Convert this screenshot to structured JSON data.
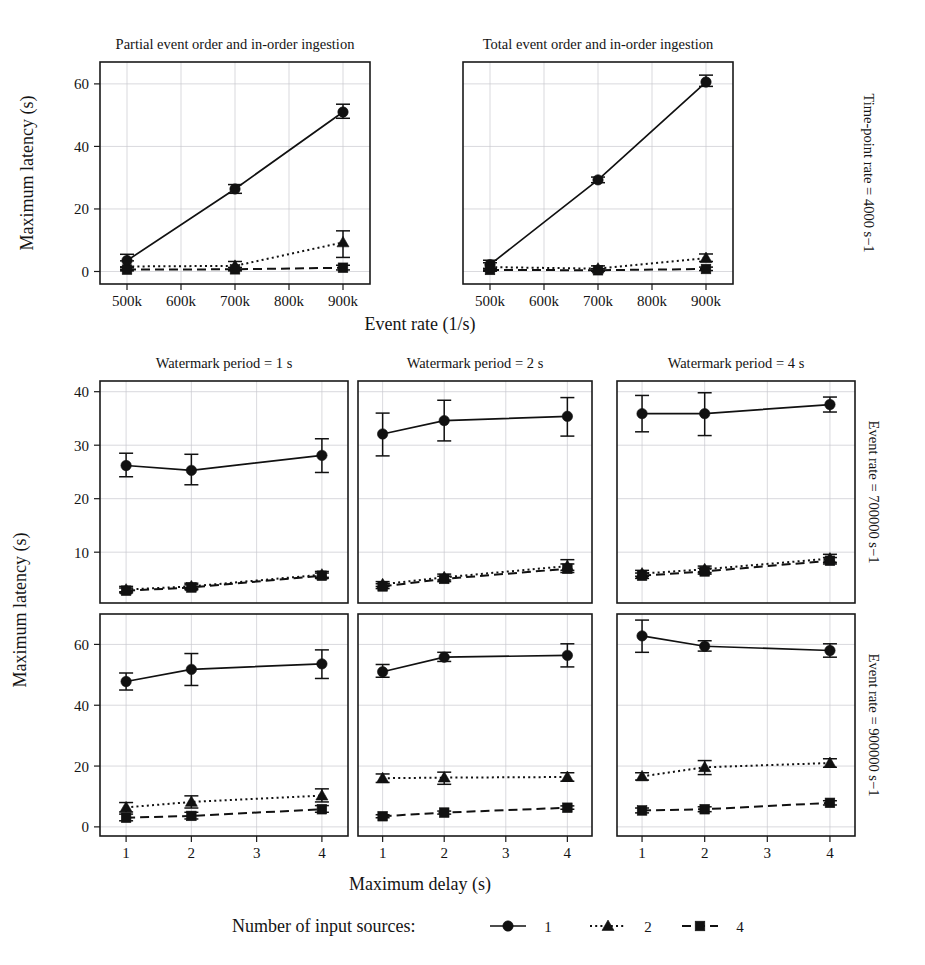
{
  "figure": {
    "axis_titles": {
      "top_x": "Event rate (1/s)",
      "bottom_x": "Maximum delay (s)",
      "y": "Maximum latency (s)"
    },
    "legend": {
      "title": "Number of input sources:",
      "entries": [
        {
          "label": "1",
          "marker": "circle",
          "dash": "solid"
        },
        {
          "label": "2",
          "marker": "triangle",
          "dash": "dotted"
        },
        {
          "label": "4",
          "marker": "square",
          "dash": "dashed"
        }
      ]
    },
    "strip_labels": {
      "top": "Time-point rate = 4000 s−1",
      "middle": "Event rate = 700000 s−1",
      "bottom": "Event rate = 900000 s−1"
    }
  },
  "chart_data": [
    {
      "type": "line",
      "panel_id": "top-left",
      "title": "Partial event order and in-order ingestion",
      "strip_right": "Time-point rate = 4000 s−1",
      "xlabel": "Event rate (1/s)",
      "ylabel": "Maximum latency (s)",
      "x": [
        500000,
        700000,
        900000
      ],
      "xtick_values": [
        500000,
        600000,
        700000,
        800000,
        900000
      ],
      "xtick_labels": [
        "500k",
        "600k",
        "700k",
        "800k",
        "900k"
      ],
      "ytick_values": [
        0,
        20,
        40,
        60
      ],
      "ytick_labels": [
        "0",
        "20",
        "40",
        "60"
      ],
      "xlim": [
        450000,
        950000
      ],
      "ylim": [
        -4,
        67
      ],
      "grid": true,
      "series": [
        {
          "name": "1",
          "marker": "circle",
          "dash": "solid",
          "values": [
            3.5,
            26.4,
            51.0
          ],
          "err_low": [
            1.5,
            25.0,
            49.0
          ],
          "err_high": [
            5.5,
            27.8,
            53.5
          ]
        },
        {
          "name": "2",
          "marker": "triangle",
          "dash": "dotted",
          "values": [
            1.6,
            1.8,
            9.3
          ],
          "err_low": [
            0.6,
            0.6,
            4.5
          ],
          "err_high": [
            3.4,
            3.2,
            13.0
          ]
        },
        {
          "name": "4",
          "marker": "square",
          "dash": "dashed",
          "values": [
            0.6,
            0.7,
            1.2
          ],
          "err_low": [
            0.2,
            0.2,
            0.5
          ],
          "err_high": [
            1.2,
            1.3,
            2.0
          ]
        }
      ]
    },
    {
      "type": "line",
      "panel_id": "top-right",
      "title": "Total event order and in-order ingestion",
      "strip_right": "Time-point rate = 4000 s−1",
      "xlabel": "Event rate (1/s)",
      "ylabel": "Maximum latency (s)",
      "x": [
        500000,
        700000,
        900000
      ],
      "xtick_values": [
        500000,
        600000,
        700000,
        800000,
        900000
      ],
      "xtick_labels": [
        "500k",
        "600k",
        "700k",
        "800k",
        "900k"
      ],
      "ytick_values": [
        0,
        20,
        40,
        60
      ],
      "ytick_labels": [
        "0",
        "20",
        "40",
        "60"
      ],
      "xlim": [
        450000,
        950000
      ],
      "ylim": [
        -4,
        67
      ],
      "grid": true,
      "series": [
        {
          "name": "1",
          "marker": "circle",
          "dash": "solid",
          "values": [
            2.2,
            29.3,
            60.6
          ],
          "err_low": [
            0.8,
            28.4,
            59.2
          ],
          "err_high": [
            3.6,
            30.2,
            62.8
          ]
        },
        {
          "name": "2",
          "marker": "triangle",
          "dash": "dotted",
          "values": [
            1.4,
            0.9,
            4.3
          ],
          "err_low": [
            0.4,
            0.3,
            3.2
          ],
          "err_high": [
            2.8,
            1.8,
            5.6
          ]
        },
        {
          "name": "4",
          "marker": "square",
          "dash": "dashed",
          "values": [
            0.5,
            0.4,
            0.8
          ],
          "err_low": [
            0.1,
            0.1,
            0.3
          ],
          "err_high": [
            1.0,
            0.9,
            1.4
          ]
        }
      ]
    },
    {
      "type": "line",
      "panel_id": "mid-wm1",
      "title": "Watermark period = 1 s",
      "strip_right": "Event rate = 700000 s−1",
      "xlabel": "Maximum delay (s)",
      "ylabel": "Maximum latency (s)",
      "x": [
        1,
        2,
        4
      ],
      "xtick_values": [
        1,
        2,
        3,
        4
      ],
      "xtick_labels": [
        "1",
        "2",
        "3",
        "4"
      ],
      "ytick_values": [
        10,
        20,
        30,
        40
      ],
      "ytick_labels": [
        "10",
        "20",
        "30",
        "40"
      ],
      "xlim": [
        0.6,
        4.4
      ],
      "ylim": [
        0.5,
        42
      ],
      "grid": true,
      "series": [
        {
          "name": "1",
          "marker": "circle",
          "dash": "solid",
          "values": [
            26.2,
            25.3,
            28.1
          ],
          "err_low": [
            24.1,
            22.6,
            24.9
          ],
          "err_high": [
            28.5,
            28.3,
            31.2
          ]
        },
        {
          "name": "2",
          "marker": "triangle",
          "dash": "dotted",
          "values": [
            3.0,
            3.6,
            5.8
          ],
          "err_low": [
            2.6,
            3.2,
            5.3
          ],
          "err_high": [
            3.6,
            4.2,
            6.4
          ]
        },
        {
          "name": "4",
          "marker": "square",
          "dash": "dashed",
          "values": [
            2.8,
            3.4,
            5.6
          ],
          "err_low": [
            2.4,
            3.0,
            5.1
          ],
          "err_high": [
            3.3,
            3.9,
            6.1
          ]
        }
      ]
    },
    {
      "type": "line",
      "panel_id": "mid-wm2",
      "title": "Watermark period = 2 s",
      "strip_right": "Event rate = 700000 s−1",
      "xlabel": "Maximum delay (s)",
      "ylabel": "Maximum latency (s)",
      "x": [
        1,
        2,
        4
      ],
      "xtick_values": [
        1,
        2,
        3,
        4
      ],
      "xtick_labels": [
        "1",
        "2",
        "3",
        "4"
      ],
      "ytick_values": [
        10,
        20,
        30,
        40
      ],
      "ytick_labels": [
        "10",
        "20",
        "30",
        "40"
      ],
      "xlim": [
        0.6,
        4.4
      ],
      "ylim": [
        0.5,
        42
      ],
      "grid": true,
      "series": [
        {
          "name": "1",
          "marker": "circle",
          "dash": "solid",
          "values": [
            32.1,
            34.6,
            35.4
          ],
          "err_low": [
            28.0,
            30.8,
            31.7
          ],
          "err_high": [
            36.0,
            38.4,
            38.9
          ]
        },
        {
          "name": "2",
          "marker": "triangle",
          "dash": "dotted",
          "values": [
            4.0,
            5.3,
            7.4
          ],
          "err_low": [
            3.6,
            4.8,
            6.6
          ],
          "err_high": [
            4.5,
            5.9,
            8.6
          ]
        },
        {
          "name": "4",
          "marker": "square",
          "dash": "dashed",
          "values": [
            3.6,
            5.0,
            6.9
          ],
          "err_low": [
            3.2,
            4.5,
            6.2
          ],
          "err_high": [
            4.1,
            5.5,
            7.8
          ]
        }
      ]
    },
    {
      "type": "line",
      "panel_id": "mid-wm4",
      "title": "Watermark period = 4 s",
      "strip_right": "Event rate = 700000 s−1",
      "xlabel": "Maximum delay (s)",
      "ylabel": "Maximum latency (s)",
      "x": [
        1,
        2,
        4
      ],
      "xtick_values": [
        1,
        2,
        3,
        4
      ],
      "xtick_labels": [
        "1",
        "2",
        "3",
        "4"
      ],
      "ytick_values": [
        10,
        20,
        30,
        40
      ],
      "ytick_labels": [
        "10",
        "20",
        "30",
        "40"
      ],
      "xlim": [
        0.6,
        4.4
      ],
      "ylim": [
        0.5,
        42
      ],
      "grid": true,
      "series": [
        {
          "name": "1",
          "marker": "circle",
          "dash": "solid",
          "values": [
            35.9,
            35.9,
            37.6
          ],
          "err_low": [
            32.5,
            31.8,
            36.2
          ],
          "err_high": [
            39.3,
            39.8,
            39.0
          ]
        },
        {
          "name": "2",
          "marker": "triangle",
          "dash": "dotted",
          "values": [
            6.0,
            6.8,
            8.8
          ],
          "err_low": [
            5.5,
            6.2,
            8.1
          ],
          "err_high": [
            6.6,
            7.4,
            9.6
          ]
        },
        {
          "name": "4",
          "marker": "square",
          "dash": "dashed",
          "values": [
            5.6,
            6.4,
            8.4
          ],
          "err_low": [
            5.1,
            5.9,
            7.8
          ],
          "err_high": [
            6.1,
            7.0,
            9.0
          ]
        }
      ]
    },
    {
      "type": "line",
      "panel_id": "bot-wm1",
      "title": "Watermark period = 1 s",
      "strip_right": "Event rate = 900000 s−1",
      "xlabel": "Maximum delay (s)",
      "ylabel": "Maximum latency (s)",
      "x": [
        1,
        2,
        4
      ],
      "xtick_values": [
        1,
        2,
        3,
        4
      ],
      "xtick_labels": [
        "1",
        "2",
        "3",
        "4"
      ],
      "ytick_values": [
        0,
        20,
        40,
        60
      ],
      "ytick_labels": [
        "0",
        "20",
        "40",
        "60"
      ],
      "xlim": [
        0.6,
        4.4
      ],
      "ylim": [
        -3,
        70
      ],
      "grid": true,
      "series": [
        {
          "name": "1",
          "marker": "circle",
          "dash": "solid",
          "values": [
            47.8,
            51.8,
            53.6
          ],
          "err_low": [
            45.0,
            46.5,
            48.8
          ],
          "err_high": [
            50.6,
            57.0,
            58.2
          ]
        },
        {
          "name": "2",
          "marker": "triangle",
          "dash": "dotted",
          "values": [
            6.4,
            8.2,
            10.3
          ],
          "err_low": [
            4.9,
            6.2,
            8.2
          ],
          "err_high": [
            8.0,
            10.2,
            12.5
          ]
        },
        {
          "name": "4",
          "marker": "square",
          "dash": "dashed",
          "values": [
            3.0,
            3.6,
            5.8
          ],
          "err_low": [
            2.0,
            2.6,
            4.8
          ],
          "err_high": [
            4.2,
            4.8,
            7.0
          ]
        }
      ]
    },
    {
      "type": "line",
      "panel_id": "bot-wm2",
      "title": "Watermark period = 2 s",
      "strip_right": "Event rate = 900000 s−1",
      "xlabel": "Maximum delay (s)",
      "ylabel": "Maximum latency (s)",
      "x": [
        1,
        2,
        4
      ],
      "xtick_values": [
        1,
        2,
        3,
        4
      ],
      "xtick_labels": [
        "1",
        "2",
        "3",
        "4"
      ],
      "ytick_values": [
        0,
        20,
        40,
        60
      ],
      "ytick_labels": [
        "0",
        "20",
        "40",
        "60"
      ],
      "xlim": [
        0.6,
        4.4
      ],
      "ylim": [
        -3,
        70
      ],
      "grid": true,
      "series": [
        {
          "name": "1",
          "marker": "circle",
          "dash": "solid",
          "values": [
            51.0,
            55.8,
            56.4
          ],
          "err_low": [
            49.2,
            54.4,
            52.6
          ],
          "err_high": [
            53.4,
            57.4,
            60.2
          ]
        },
        {
          "name": "2",
          "marker": "triangle",
          "dash": "dotted",
          "values": [
            16.0,
            16.2,
            16.4
          ],
          "err_low": [
            14.6,
            14.0,
            15.0
          ],
          "err_high": [
            17.4,
            18.0,
            17.8
          ]
        },
        {
          "name": "4",
          "marker": "square",
          "dash": "dashed",
          "values": [
            3.5,
            4.7,
            6.3
          ],
          "err_low": [
            3.0,
            4.2,
            5.8
          ],
          "err_high": [
            4.0,
            5.2,
            6.9
          ]
        }
      ]
    },
    {
      "type": "line",
      "panel_id": "bot-wm4",
      "title": "Watermark period = 4 s",
      "strip_right": "Event rate = 900000 s−1",
      "xlabel": "Maximum delay (s)",
      "ylabel": "Maximum latency (s)",
      "x": [
        1,
        2,
        4
      ],
      "xtick_values": [
        1,
        2,
        3,
        4
      ],
      "xtick_labels": [
        "1",
        "2",
        "3",
        "4"
      ],
      "ytick_values": [
        0,
        20,
        40,
        60
      ],
      "ytick_labels": [
        "0",
        "20",
        "40",
        "60"
      ],
      "xlim": [
        0.6,
        4.4
      ],
      "ylim": [
        -3,
        70
      ],
      "grid": true,
      "series": [
        {
          "name": "1",
          "marker": "circle",
          "dash": "solid",
          "values": [
            62.8,
            59.4,
            58.0
          ],
          "err_low": [
            57.4,
            57.8,
            55.8
          ],
          "err_high": [
            68.0,
            61.2,
            60.2
          ]
        },
        {
          "name": "2",
          "marker": "triangle",
          "dash": "dotted",
          "values": [
            16.6,
            19.6,
            21.0
          ],
          "err_low": [
            15.4,
            17.2,
            19.6
          ],
          "err_high": [
            17.8,
            21.8,
            22.4
          ]
        },
        {
          "name": "4",
          "marker": "square",
          "dash": "dashed",
          "values": [
            5.4,
            5.8,
            7.9
          ],
          "err_low": [
            4.6,
            5.0,
            7.2
          ],
          "err_high": [
            6.2,
            6.6,
            8.6
          ]
        }
      ]
    }
  ]
}
